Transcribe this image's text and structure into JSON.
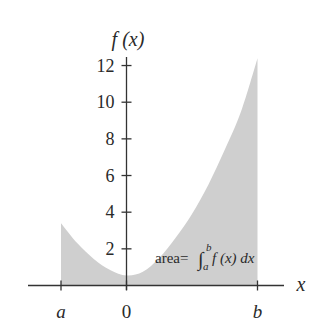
{
  "chart_data": {
    "type": "area",
    "title": "",
    "xlabel": "x",
    "ylabel": "f (x)",
    "x_tick_labels": [
      "a",
      "0",
      "b"
    ],
    "x_tick_values": [
      -1,
      0,
      2
    ],
    "y_ticks": [
      2,
      4,
      6,
      8,
      10,
      12
    ],
    "y_tick_labels": [
      "2",
      "4",
      "6",
      "8",
      "10",
      "12"
    ],
    "ylim": [
      0,
      12.5
    ],
    "xlim": [
      -1.5,
      2.4
    ],
    "grid": false,
    "shaded_region": {
      "from": "a",
      "to": "b"
    },
    "points": [
      {
        "x": -1.0,
        "y": 3.4
      },
      {
        "x": -0.75,
        "y": 2.3
      },
      {
        "x": -0.5,
        "y": 1.45
      },
      {
        "x": -0.25,
        "y": 0.85
      },
      {
        "x": 0.0,
        "y": 0.55
      },
      {
        "x": 0.25,
        "y": 0.75
      },
      {
        "x": 0.5,
        "y": 1.5
      },
      {
        "x": 0.75,
        "y": 2.6
      },
      {
        "x": 1.0,
        "y": 3.9
      },
      {
        "x": 1.25,
        "y": 5.5
      },
      {
        "x": 1.5,
        "y": 7.4
      },
      {
        "x": 1.75,
        "y": 9.5
      },
      {
        "x": 2.0,
        "y": 12.4
      }
    ],
    "annotation": {
      "prefix": "area=",
      "integral_sign": "∫",
      "upper_limit": "b",
      "lower_limit": "a",
      "integrand": "f (x) dx"
    },
    "colors": {
      "fill": "#cfcfcf",
      "axis": "#333333",
      "text": "#2a2a2a"
    }
  }
}
